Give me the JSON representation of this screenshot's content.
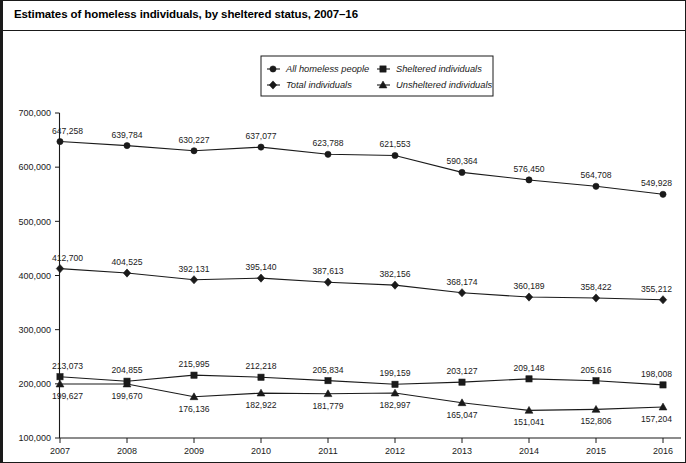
{
  "figure": {
    "title": "Estimates of homeless individuals, by sheltered status, 2007–16"
  },
  "legend": {
    "entries": [
      {
        "label": "All homeless people",
        "marker": "circle-marker-icon"
      },
      {
        "label": "Sheltered individuals",
        "marker": "square-marker-icon"
      },
      {
        "label": "Total individuals",
        "marker": "diamond-marker-icon"
      },
      {
        "label": "Unsheltered individuals",
        "marker": "triangle-marker-icon"
      }
    ]
  },
  "axes": {
    "y_ticks": [
      "100,000",
      "200,000",
      "300,000",
      "400,000",
      "500,000",
      "600,000",
      "700,000"
    ],
    "x_ticks": [
      "2007",
      "2008",
      "2009",
      "2010",
      "2011",
      "2012",
      "2013",
      "2014",
      "2015",
      "2016"
    ]
  },
  "chart_data": {
    "type": "line",
    "title": "Estimates of homeless individuals, by sheltered status, 2007–16",
    "xlabel": "",
    "ylabel": "",
    "x": [
      2007,
      2008,
      2009,
      2010,
      2011,
      2012,
      2013,
      2014,
      2015,
      2016
    ],
    "categories": [
      "2007",
      "2008",
      "2009",
      "2010",
      "2011",
      "2012",
      "2013",
      "2014",
      "2015",
      "2016"
    ],
    "ylim": [
      100000,
      700000
    ],
    "ytick_values": [
      100000,
      200000,
      300000,
      400000,
      500000,
      600000,
      700000
    ],
    "grid": false,
    "legend_position": "top-center",
    "series": [
      {
        "name": "All homeless people",
        "marker": "circle",
        "values": [
          647258,
          639784,
          630227,
          637077,
          623788,
          621553,
          590364,
          576450,
          564708,
          549928
        ],
        "labels": [
          "647,258",
          "639,784",
          "630,227",
          "637,077",
          "623,788",
          "621,553",
          "590,364",
          "576,450",
          "564,708",
          "549,928"
        ],
        "label_position": "above"
      },
      {
        "name": "Total individuals",
        "marker": "diamond",
        "values": [
          412700,
          404525,
          392131,
          395140,
          387613,
          382156,
          368174,
          360189,
          358422,
          355212
        ],
        "labels": [
          "412,700",
          "404,525",
          "392,131",
          "395,140",
          "387,613",
          "382,156",
          "368,174",
          "360,189",
          "358,422",
          "355,212"
        ],
        "label_position": "above"
      },
      {
        "name": "Sheltered individuals",
        "marker": "square",
        "values": [
          213073,
          204855,
          215995,
          212218,
          205834,
          199159,
          203127,
          209148,
          205616,
          198008
        ],
        "labels": [
          "213,073",
          "204,855",
          "215,995",
          "212,218",
          "205,834",
          "199,159",
          "203,127",
          "209,148",
          "205,616",
          "198,008"
        ],
        "label_position": "above"
      },
      {
        "name": "Unsheltered individuals",
        "marker": "triangle",
        "values": [
          199627,
          199670,
          176136,
          182922,
          181779,
          182997,
          165047,
          151041,
          152806,
          157204
        ],
        "labels": [
          "199,627",
          "199,670",
          "176,136",
          "182,922",
          "181,779",
          "182,997",
          "165,047",
          "151,041",
          "152,806",
          "157,204"
        ],
        "label_position": "below"
      }
    ]
  }
}
